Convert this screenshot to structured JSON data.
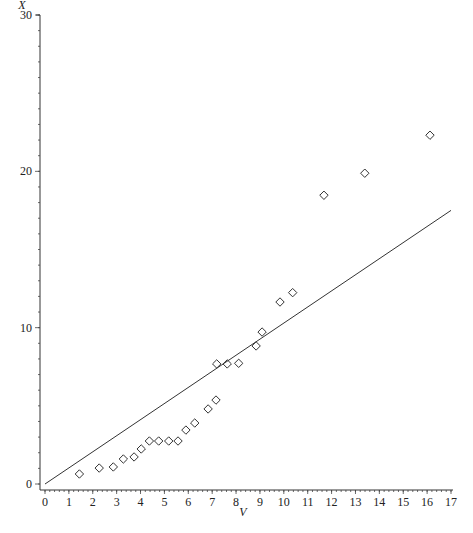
{
  "chart_data": {
    "type": "scatter",
    "title": "",
    "xlabel": "V",
    "ylabel": "X",
    "xlim": [
      0,
      17
    ],
    "ylim": [
      0,
      30
    ],
    "x_ticks": [
      0,
      1,
      2,
      3,
      4,
      5,
      6,
      7,
      8,
      9,
      10,
      11,
      12,
      13,
      14,
      15,
      16,
      17
    ],
    "x_tick_labels": [
      "0",
      "1",
      "2",
      "3",
      "4",
      "5",
      "6",
      "7",
      "8",
      "9",
      "10",
      "11",
      "12",
      "13",
      "14",
      "15",
      "16",
      "17"
    ],
    "x_minor_step": 0.2,
    "y_ticks": [
      0,
      10,
      20,
      30
    ],
    "y_tick_labels": [
      "0",
      "10",
      "20",
      "30"
    ],
    "y_minor_step": 1,
    "grid": false,
    "legend": null,
    "series": [
      {
        "name": "observations",
        "type": "scatter",
        "marker": "diamond",
        "x": [
          1.44,
          2.27,
          2.86,
          3.28,
          3.73,
          4.03,
          4.37,
          4.76,
          5.18,
          5.57,
          5.9,
          6.27,
          6.83,
          7.16,
          7.19,
          7.63,
          8.11,
          8.84,
          9.09,
          9.84,
          10.37,
          11.68,
          13.39,
          16.12
        ],
        "y": [
          0.64,
          1.02,
          1.09,
          1.6,
          1.73,
          2.24,
          2.75,
          2.75,
          2.75,
          2.75,
          3.45,
          3.9,
          4.8,
          5.37,
          7.68,
          7.68,
          7.72,
          8.83,
          9.72,
          11.64,
          12.24,
          18.47,
          19.88,
          22.31
        ]
      },
      {
        "name": "reference line",
        "type": "line",
        "x": [
          0,
          17
        ],
        "y": [
          0,
          17.5
        ]
      }
    ]
  },
  "labels": {
    "xlabel": "V",
    "ylabel": "X"
  }
}
